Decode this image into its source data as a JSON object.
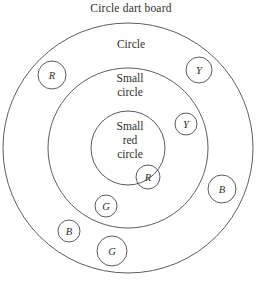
{
  "title": "Circle dart board",
  "rings": [
    {
      "id": "outer",
      "label": "Circle",
      "cx": 128,
      "cy": 148,
      "r": 125
    },
    {
      "id": "middle",
      "label": "Small\ncircle",
      "cx": 128,
      "cy": 148,
      "r": 80
    },
    {
      "id": "inner",
      "label": "Small\nred\ncircle",
      "cx": 128,
      "cy": 148,
      "r": 37
    }
  ],
  "darts": [
    {
      "letter": "R",
      "cx": 52,
      "cy": 75,
      "r": 14,
      "region": "outer"
    },
    {
      "letter": "Y",
      "cx": 199,
      "cy": 70,
      "r": 13,
      "region": "outer"
    },
    {
      "letter": "Y",
      "cx": 186,
      "cy": 124,
      "r": 11,
      "region": "middle"
    },
    {
      "letter": "R",
      "cx": 148,
      "cy": 177,
      "r": 12,
      "region": "inner"
    },
    {
      "letter": "B",
      "cx": 222,
      "cy": 189,
      "r": 14,
      "region": "outer"
    },
    {
      "letter": "G",
      "cx": 106,
      "cy": 206,
      "r": 11,
      "region": "middle"
    },
    {
      "letter": "B",
      "cx": 69,
      "cy": 231,
      "r": 11,
      "region": "outer"
    },
    {
      "letter": "G",
      "cx": 112,
      "cy": 251,
      "r": 15,
      "region": "outer"
    }
  ],
  "colors": {
    "stroke": "#4a4a4a",
    "text": "#2f2f2f",
    "background": "#ffffff"
  }
}
